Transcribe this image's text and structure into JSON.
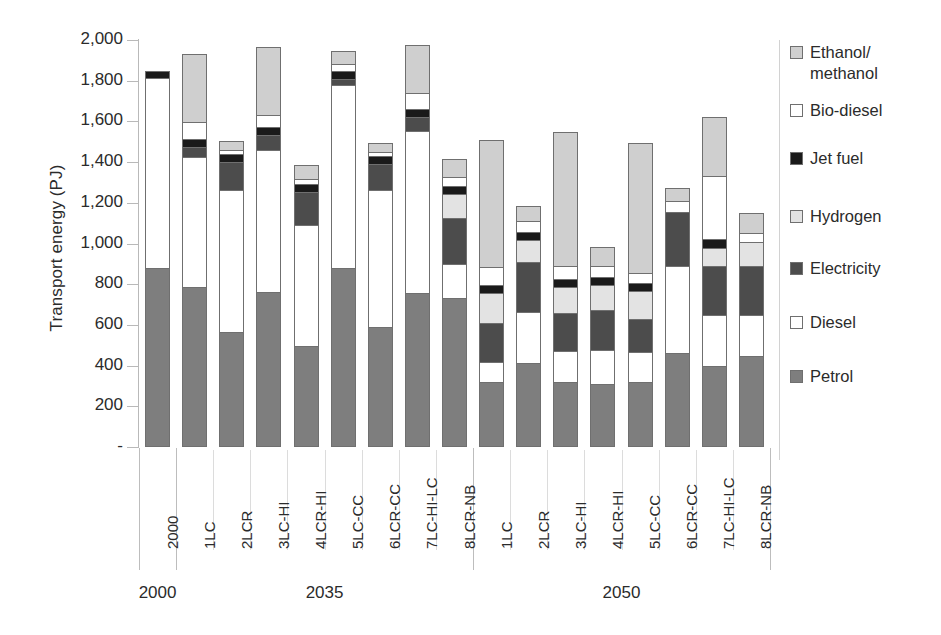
{
  "chart_data": {
    "type": "bar",
    "subtype": "stacked",
    "title": "",
    "xlabel": "",
    "ylabel": "Transport energy (PJ)",
    "ylim": [
      0,
      2000
    ],
    "ytick_values": [
      0,
      200,
      400,
      600,
      800,
      1000,
      1200,
      1400,
      1600,
      1800,
      2000
    ],
    "ytick_labels": [
      "-",
      "200",
      "400",
      "600",
      "800",
      "1,000",
      "1,200",
      "1,400",
      "1,600",
      "1,800",
      "2,000"
    ],
    "grid": false,
    "legend_position": "right",
    "series_order": [
      "Petrol",
      "Diesel",
      "Electricity",
      "Hydrogen",
      "Jet fuel",
      "Bio-diesel",
      "Ethanol/methanol"
    ],
    "series": [
      {
        "name": "Petrol",
        "color": "#7e7e7e",
        "values": [
          880,
          785,
          565,
          760,
          495,
          880,
          590,
          755,
          730,
          320,
          415,
          320,
          310,
          320,
          460,
          400,
          445
        ]
      },
      {
        "name": "Diesel",
        "color": "#ffffff",
        "values": [
          935,
          640,
          700,
          700,
          595,
          900,
          675,
          800,
          170,
          100,
          250,
          150,
          165,
          145,
          430,
          250,
          205
        ]
      },
      {
        "name": "Electricity",
        "color": "#4c4c4c",
        "values": [
          0,
          50,
          135,
          75,
          165,
          30,
          125,
          65,
          225,
          190,
          245,
          190,
          200,
          165,
          265,
          240,
          240
        ]
      },
      {
        "name": "Hydrogen",
        "color": "#e3e3e3",
        "values": [
          0,
          0,
          0,
          0,
          0,
          0,
          0,
          0,
          120,
          145,
          105,
          125,
          120,
          135,
          0,
          90,
          120
        ]
      },
      {
        "name": "Jet fuel",
        "color": "#1a1a1a",
        "values": [
          35,
          40,
          40,
          40,
          40,
          40,
          40,
          40,
          40,
          40,
          40,
          40,
          40,
          40,
          0,
          40,
          0
        ]
      },
      {
        "name": "Bio-diesel",
        "color": "#ffffff",
        "values": [
          0,
          80,
          20,
          55,
          20,
          30,
          20,
          80,
          40,
          90,
          55,
          65,
          55,
          50,
          55,
          310,
          40
        ]
      },
      {
        "name": "Ethanol/methanol",
        "color": "#cfcfcf",
        "values": [
          0,
          335,
          45,
          335,
          70,
          65,
          45,
          235,
          90,
          625,
          75,
          660,
          95,
          640,
          65,
          290,
          100
        ]
      }
    ],
    "categories": [
      {
        "label": "2000",
        "group": "2000"
      },
      {
        "label": "1LC",
        "group": "2035"
      },
      {
        "label": "2LCR",
        "group": "2035"
      },
      {
        "label": "3LC-HI",
        "group": "2035"
      },
      {
        "label": "4LCR-HI",
        "group": "2035"
      },
      {
        "label": "5LC-CC",
        "group": "2035"
      },
      {
        "label": "6LCR-CC",
        "group": "2035"
      },
      {
        "label": "7LC-HI-LC",
        "group": "2035"
      },
      {
        "label": "8LCR-NB",
        "group": "2035"
      },
      {
        "label": "1LC",
        "group": "2050"
      },
      {
        "label": "2LCR",
        "group": "2050"
      },
      {
        "label": "3LC-HI",
        "group": "2050"
      },
      {
        "label": "4LCR-HI",
        "group": "2050"
      },
      {
        "label": "5LC-CC",
        "group": "2050"
      },
      {
        "label": "6LCR-CC",
        "group": "2050"
      },
      {
        "label": "7LC-HI-LC",
        "group": "2050"
      },
      {
        "label": "8LCR-NB",
        "group": "2050"
      }
    ],
    "totals": [
      1850,
      1930,
      1505,
      1965,
      1385,
      1945,
      1495,
      1975,
      1375,
      1510,
      1185,
      1550,
      1165,
      1495,
      1275,
      1620,
      1150
    ],
    "groups": [
      {
        "label": "2000",
        "count": 1
      },
      {
        "label": "2035",
        "count": 8
      },
      {
        "label": "2050",
        "count": 8
      }
    ]
  },
  "legend": {
    "items": [
      {
        "label": "Ethanol/\nmethanol",
        "color": "#cfcfcf",
        "name": "ethanol-methanol"
      },
      {
        "label": "Bio-diesel",
        "color": "#ffffff",
        "name": "bio-diesel"
      },
      {
        "label": "Jet fuel",
        "color": "#1a1a1a",
        "name": "jet-fuel"
      },
      {
        "label": "Hydrogen",
        "color": "#e3e3e3",
        "name": "hydrogen"
      },
      {
        "label": "Electricity",
        "color": "#4c4c4c",
        "name": "electricity"
      },
      {
        "label": "Diesel",
        "color": "#ffffff",
        "name": "diesel"
      },
      {
        "label": "Petrol",
        "color": "#7e7e7e",
        "name": "petrol"
      }
    ]
  }
}
